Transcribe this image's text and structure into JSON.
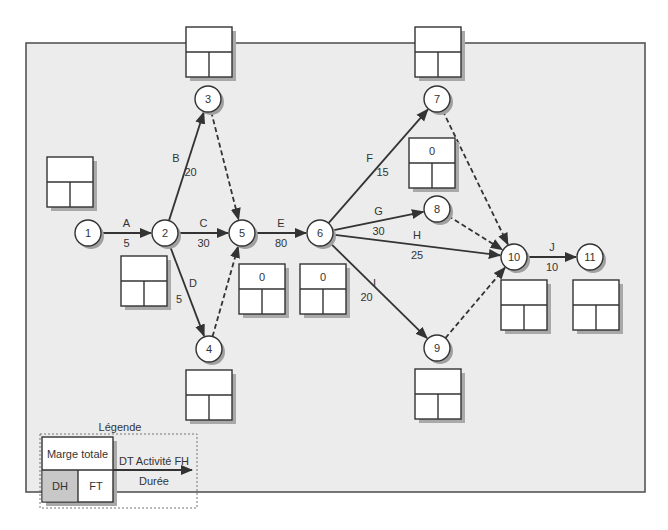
{
  "diagram": {
    "type": "PERT network",
    "nodes": [
      {
        "id": "1",
        "x": 88,
        "y": 233
      },
      {
        "id": "2",
        "x": 165,
        "y": 233
      },
      {
        "id": "3",
        "x": 208,
        "y": 99
      },
      {
        "id": "4",
        "x": 209,
        "y": 349
      },
      {
        "id": "5",
        "x": 242,
        "y": 233
      },
      {
        "id": "6",
        "x": 320,
        "y": 233
      },
      {
        "id": "7",
        "x": 437,
        "y": 99
      },
      {
        "id": "8",
        "x": 437,
        "y": 209
      },
      {
        "id": "9",
        "x": 437,
        "y": 348
      },
      {
        "id": "10",
        "x": 514,
        "y": 257
      },
      {
        "id": "11",
        "x": 590,
        "y": 257
      }
    ],
    "activities": [
      {
        "name": "A",
        "duration": "5",
        "from": "1",
        "to": "2",
        "dummy": false
      },
      {
        "name": "B",
        "duration": "20",
        "from": "2",
        "to": "3",
        "dummy": false
      },
      {
        "name": "C",
        "duration": "30",
        "from": "2",
        "to": "5",
        "dummy": false
      },
      {
        "name": "D",
        "duration": "5",
        "from": "2",
        "to": "4",
        "dummy": false
      },
      {
        "name": "E",
        "duration": "80",
        "from": "5",
        "to": "6",
        "dummy": false
      },
      {
        "name": "F",
        "duration": "15",
        "from": "6",
        "to": "7",
        "dummy": false
      },
      {
        "name": "G",
        "duration": "30",
        "from": "6",
        "to": "8",
        "dummy": false
      },
      {
        "name": "H",
        "duration": "25",
        "from": "6",
        "to": "10",
        "dummy": false
      },
      {
        "name": "I",
        "duration": "20",
        "from": "6",
        "to": "9",
        "dummy": false
      },
      {
        "name": "J",
        "duration": "10",
        "from": "10",
        "to": "11",
        "dummy": false
      },
      {
        "name": "",
        "duration": "",
        "from": "3",
        "to": "5",
        "dummy": true
      },
      {
        "name": "",
        "duration": "",
        "from": "4",
        "to": "5",
        "dummy": true
      },
      {
        "name": "",
        "duration": "",
        "from": "7",
        "to": "10",
        "dummy": true
      },
      {
        "name": "",
        "duration": "",
        "from": "8",
        "to": "10",
        "dummy": true
      },
      {
        "name": "",
        "duration": "",
        "from": "9",
        "to": "10",
        "dummy": true
      }
    ],
    "boxes": [
      {
        "for": "1",
        "x": 47,
        "y": 157,
        "marge": ""
      },
      {
        "for": "2",
        "x": 121,
        "y": 256,
        "marge": ""
      },
      {
        "for": "3",
        "x": 186,
        "y": 27,
        "marge": ""
      },
      {
        "for": "4",
        "x": 186,
        "y": 370,
        "marge": ""
      },
      {
        "for": "5",
        "x": 239,
        "y": 264,
        "marge": "0"
      },
      {
        "for": "6",
        "x": 300,
        "y": 264,
        "marge": "0"
      },
      {
        "for": "7",
        "x": 415,
        "y": 27,
        "marge": ""
      },
      {
        "for": "8",
        "x": 409,
        "y": 138,
        "marge": "0"
      },
      {
        "for": "9",
        "x": 415,
        "y": 369,
        "marge": ""
      },
      {
        "for": "10",
        "x": 501,
        "y": 280,
        "marge": ""
      },
      {
        "for": "11",
        "x": 573,
        "y": 280,
        "marge": ""
      }
    ]
  },
  "legend": {
    "title": "Légende",
    "marge_label": "Marge totale",
    "dh_label": "DH",
    "ft_label": "FT",
    "arrow_top_label": "DT Activité FH",
    "arrow_bottom_label": "Durée"
  },
  "colors": {
    "frame_bg": "#ececec",
    "stroke": "#333333",
    "legend_dh_fill": "#c8c8c8"
  }
}
